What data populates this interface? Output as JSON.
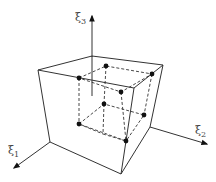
{
  "diagram": {
    "title": "",
    "axes": [
      {
        "id": "xi1",
        "symbol": "ξ",
        "subscript": "1",
        "label": "ξ1"
      },
      {
        "id": "xi2",
        "symbol": "ξ",
        "subscript": "2",
        "label": "ξ2"
      },
      {
        "id": "xi3",
        "symbol": "ξ",
        "subscript": "3",
        "label": "ξ3"
      }
    ],
    "element": "hexahedral (brick) element with 8 interior nodes shown as dots, connected by dashed lines forming an inner cube",
    "node_count": 8,
    "colors": {
      "line": "#333333",
      "node": "#111111",
      "label": "#444444",
      "background": "#ffffff"
    }
  }
}
